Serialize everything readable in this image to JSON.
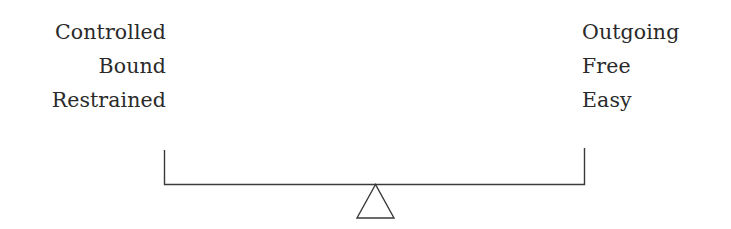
{
  "diagram": {
    "type": "balance-scale",
    "left_labels": [
      "Controlled",
      "Bound",
      "Restrained"
    ],
    "right_labels": [
      "Outgoing",
      "Free",
      "Easy"
    ],
    "colors": {
      "text": "#2a2a2a",
      "line": "#3a3a3a",
      "background": "#ffffff"
    }
  }
}
